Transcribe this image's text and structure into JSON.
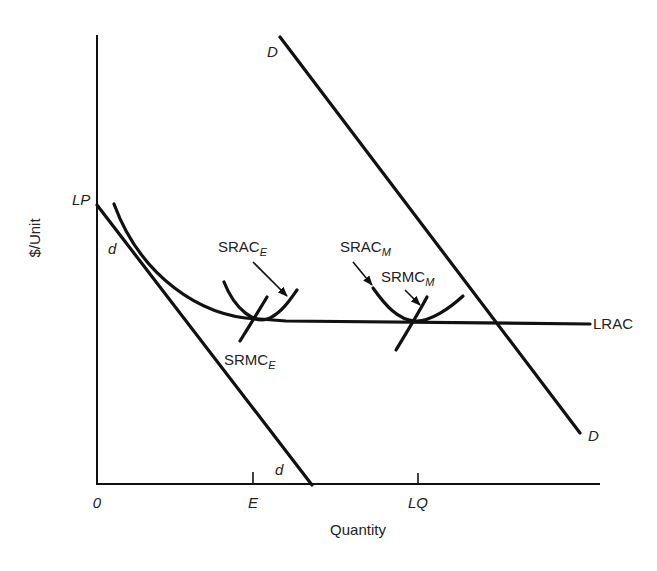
{
  "diagram": {
    "type": "economics-cost-curves",
    "axes": {
      "y_label": "$/Unit",
      "x_label": "Quantity",
      "origin": "0",
      "y_tick_label": "LP",
      "x_ticks": [
        "E",
        "LQ"
      ]
    },
    "curves": {
      "demand_industry": {
        "label_top": "D",
        "label_bottom": "D"
      },
      "demand_firm": {
        "label_top": "d",
        "label_bottom": "d"
      },
      "lrac": {
        "label": "LRAC"
      },
      "srac_e": {
        "base": "SRAC",
        "sub": "E"
      },
      "srmc_e": {
        "base": "SRMC",
        "sub": "E"
      },
      "srac_m": {
        "base": "SRAC",
        "sub": "M"
      },
      "srmc_m": {
        "base": "SRMC",
        "sub": "M"
      }
    }
  }
}
